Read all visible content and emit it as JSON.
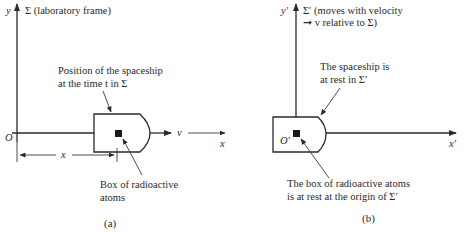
{
  "panel_a": {
    "y_axis_label": "y",
    "frame_label": "Σ (laboratory frame)",
    "origin_label": "O",
    "x_axis_label": "x",
    "velocity_label": "v",
    "distance_label": "x",
    "spaceship_note_line1": "Position of the spaceship",
    "spaceship_note_line2": "at the time t in Σ",
    "box_note_line1": "Box of radioactive",
    "box_note_line2": "atoms",
    "caption": "(a)"
  },
  "panel_b": {
    "y_axis_label": "y′",
    "frame_label_line1": "Σ′ (moves with velocity",
    "frame_label_line2": "➞ v relative to Σ)",
    "origin_label": "O′",
    "x_axis_label": "x′",
    "spaceship_note_line1": "The spaceship is",
    "spaceship_note_line2": "at rest in Σ′",
    "box_note_line1": "The box of radioactive atoms",
    "box_note_line2": "is at rest at the origin of Σ′",
    "caption": "(b)"
  }
}
